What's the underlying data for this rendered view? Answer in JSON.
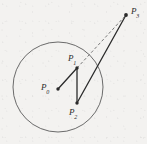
{
  "figure": {
    "background_color": "#f3f2f0",
    "stroke_color": "#2b2b2b",
    "circle_stroke_color": "#6b6b6b",
    "width": 147,
    "height": 144
  },
  "chart_data": {
    "type": "scatter",
    "title": "",
    "xlabel": "",
    "ylabel": "",
    "grid": false,
    "legend": null,
    "xlim": [
      0,
      147
    ],
    "ylim": [
      0,
      144
    ],
    "circle": {
      "center": [
        58,
        87
      ],
      "radius": 45,
      "style": "solid",
      "stroke": "#6b6b6b",
      "fill": "none"
    },
    "points": [
      {
        "name": "P0",
        "label": "P",
        "subscript": "0",
        "x": 58,
        "y": 89,
        "inside_circle": true
      },
      {
        "name": "P1",
        "label": "P",
        "subscript": "1",
        "x": 77,
        "y": 68,
        "inside_circle": true
      },
      {
        "name": "P2",
        "label": "P",
        "subscript": "2",
        "x": 77,
        "y": 103,
        "inside_circle": true
      },
      {
        "name": "P3",
        "label": "P",
        "subscript": "3",
        "x": 126,
        "y": 15,
        "inside_circle": false
      }
    ],
    "segments": [
      {
        "name": "P0-P1",
        "from": "P0",
        "to": "P1",
        "style": "solid",
        "x1": 58,
        "y1": 89,
        "x2": 77,
        "y2": 68
      },
      {
        "name": "P1-P2",
        "from": "P1",
        "to": "P2",
        "style": "solid",
        "x1": 77,
        "y1": 68,
        "x2": 77,
        "y2": 103
      },
      {
        "name": "P2-P3",
        "from": "P2",
        "to": "P3",
        "style": "solid",
        "x1": 77,
        "y1": 103,
        "x2": 126,
        "y2": 15
      },
      {
        "name": "P1-P3",
        "from": "P1",
        "to": "P3",
        "style": "dashed",
        "x1": 77,
        "y1": 68,
        "x2": 126,
        "y2": 15
      }
    ]
  },
  "labels": {
    "p0": {
      "base": "P",
      "sub": "0"
    },
    "p1": {
      "base": "P",
      "sub": "1"
    },
    "p2": {
      "base": "P",
      "sub": "2"
    },
    "p3": {
      "base": "P",
      "sub": "3"
    }
  }
}
